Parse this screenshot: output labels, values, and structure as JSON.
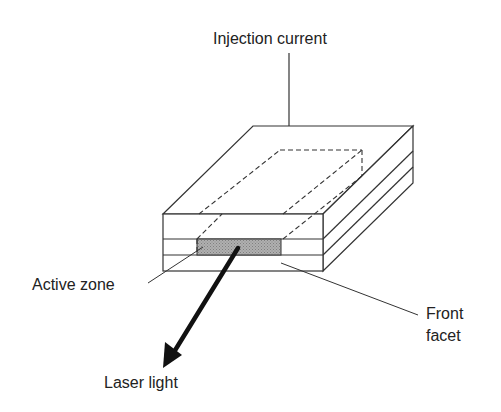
{
  "diagram": {
    "labels": {
      "injection_current": "Injection current",
      "active_zone": "Active zone",
      "front_facet_line1": "Front",
      "front_facet_line2": "facet",
      "laser_light": "Laser light"
    },
    "colors": {
      "stroke": "#333333",
      "active_zone_fill": "#a8a8a8",
      "background": "#ffffff",
      "arrow": "#111111"
    }
  }
}
